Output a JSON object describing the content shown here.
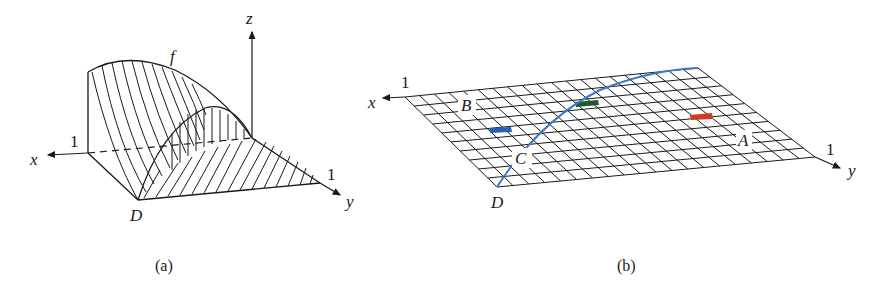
{
  "panels": [
    {
      "id": "a",
      "caption": "(a)",
      "labels": {
        "function": "f",
        "x_axis": "x",
        "y_axis": "y",
        "z_axis": "z",
        "x_tick": "1",
        "y_tick": "1",
        "domain": "D"
      },
      "description": "3D surface f over triangular domain D with hatching"
    },
    {
      "id": "b",
      "caption": "(b)",
      "labels": {
        "x_axis": "x",
        "y_axis": "y",
        "x_tick": "1",
        "y_tick": "1",
        "domain": "D",
        "point_a": "A",
        "point_b": "B",
        "point_c": "C"
      },
      "grid": {
        "rows": 10,
        "cols": 20
      },
      "highlighted_cells": [
        {
          "color": "#2a5fb5",
          "name": "blue"
        },
        {
          "color": "#1f5a2e",
          "name": "green"
        },
        {
          "color": "#d33a22",
          "name": "red"
        }
      ],
      "curve_color": "#3a78c8",
      "description": "Flat grid over domain with a blue curve and three colored cells"
    }
  ]
}
